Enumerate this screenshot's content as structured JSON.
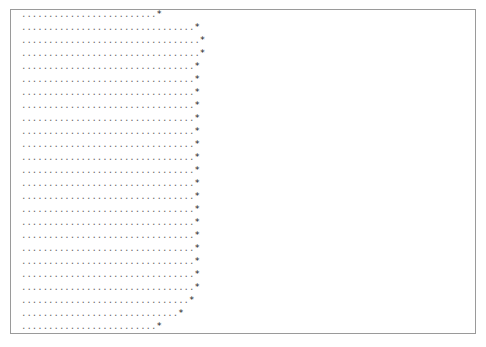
{
  "output": {
    "dot_char": ".",
    "marker_char": "*",
    "rows": [
      {
        "dots": 25
      },
      {
        "dots": 32
      },
      {
        "dots": 33
      },
      {
        "dots": 33
      },
      {
        "dots": 32
      },
      {
        "dots": 32
      },
      {
        "dots": 32
      },
      {
        "dots": 32
      },
      {
        "dots": 32
      },
      {
        "dots": 32
      },
      {
        "dots": 32
      },
      {
        "dots": 32
      },
      {
        "dots": 32
      },
      {
        "dots": 32
      },
      {
        "dots": 32
      },
      {
        "dots": 32
      },
      {
        "dots": 32
      },
      {
        "dots": 32
      },
      {
        "dots": 32
      },
      {
        "dots": 32
      },
      {
        "dots": 32
      },
      {
        "dots": 32
      },
      {
        "dots": 31
      },
      {
        "dots": 29
      },
      {
        "dots": 25
      }
    ]
  }
}
